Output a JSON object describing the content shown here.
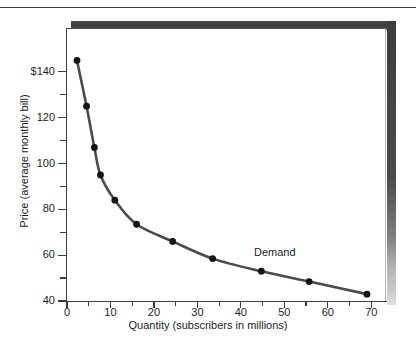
{
  "chart_data": {
    "type": "line",
    "title": "",
    "xlabel": "Quantity (subscribers in millions)",
    "ylabel": "Price (average monthly bill)",
    "xlim": [
      0,
      72
    ],
    "ylim": [
      40,
      150
    ],
    "grid": false,
    "legend_position": "inline-right",
    "series": [
      {
        "name": "Demand",
        "x": [
          2.3,
          4.5,
          6.3,
          7.7,
          11.0,
          16.0,
          24.3,
          33.5,
          44.7,
          55.7,
          69.0
        ],
        "y": [
          145,
          125,
          107,
          95,
          84,
          73.5,
          66,
          58.5,
          53,
          48.5,
          43
        ],
        "color": "#4a4a4a",
        "marker": "circle",
        "marker_color": "#141414"
      }
    ],
    "x_ticks": [
      0,
      10,
      20,
      30,
      40,
      50,
      60,
      70
    ],
    "x_tick_labels": [
      "0",
      "10",
      "20",
      "30",
      "40",
      "50",
      "60",
      "70"
    ],
    "x_minor_ticks": [
      5,
      15,
      25,
      35,
      45,
      55,
      65
    ],
    "y_ticks": [
      40,
      60,
      80,
      100,
      120,
      140
    ],
    "y_tick_labels": [
      "40",
      "60",
      "80",
      "100",
      "120",
      "$140"
    ],
    "y_minor_ticks": [
      50,
      70,
      90,
      110,
      130
    ],
    "annotations": [
      {
        "text": "Demand",
        "x": 49.0,
        "y": 61.0
      }
    ]
  },
  "figure": {
    "frame_color": "#4a4a4a",
    "shadow_color": "#3d3d3d",
    "background": "#ffffff"
  }
}
